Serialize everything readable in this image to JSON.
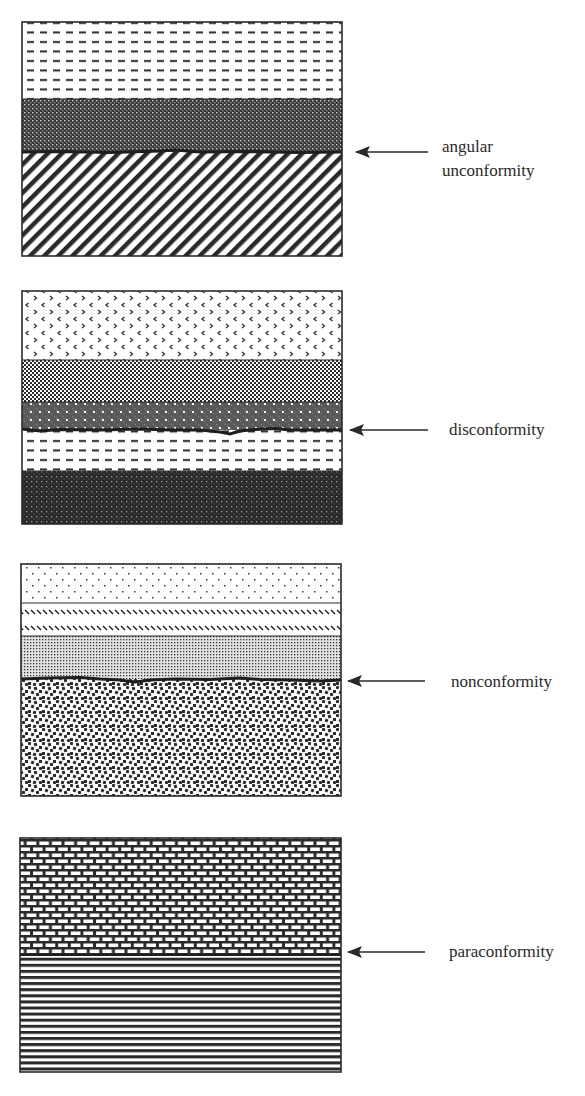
{
  "figure": {
    "panels": [
      {
        "id": "angular-unconformity",
        "label_lines": [
          "angular",
          "unconformity"
        ],
        "box": {
          "x": 22,
          "y": 22,
          "w": 320,
          "h": 234
        },
        "layers": [
          {
            "name": "shale",
            "pattern": "dashes",
            "y0": 22,
            "y1": 99
          },
          {
            "name": "crosshatch-dark",
            "pattern": "crosshatch",
            "y0": 99,
            "y1": 152
          },
          {
            "name": "tilted-strata",
            "pattern": "diagonal-lines",
            "y0": 152,
            "y1": 256
          }
        ],
        "contact_y": 152,
        "arrow": {
          "tip_x": 355,
          "tail_x": 428,
          "y": 152
        }
      },
      {
        "id": "disconformity",
        "label_lines": [
          "disconformity"
        ],
        "box": {
          "x": 22,
          "y": 291,
          "w": 320,
          "h": 233
        },
        "layers": [
          {
            "name": "chevron-layer",
            "pattern": "chevrons",
            "y0": 291,
            "y1": 360
          },
          {
            "name": "checker-layer",
            "pattern": "checker",
            "y0": 360,
            "y1": 402
          },
          {
            "name": "grey-dotted-layer",
            "pattern": "grey-dots",
            "y0": 402,
            "y1": 430
          },
          {
            "name": "shale",
            "pattern": "dashes",
            "y0": 430,
            "y1": 471
          },
          {
            "name": "dark-dotted-layer",
            "pattern": "dark-dots",
            "y0": 471,
            "y1": 524
          }
        ],
        "contact_y": 430,
        "arrow": {
          "tip_x": 349,
          "tail_x": 428,
          "y": 430
        }
      },
      {
        "id": "nonconformity",
        "label_lines": [
          "nonconformity"
        ],
        "box": {
          "x": 21,
          "y": 564,
          "w": 320,
          "h": 232
        },
        "layers": [
          {
            "name": "sandstone",
            "pattern": "sparse-dots",
            "y0": 564,
            "y1": 603
          },
          {
            "name": "backslash-layer",
            "pattern": "backslash-hatch",
            "y0": 603,
            "y1": 636
          },
          {
            "name": "siltstone",
            "pattern": "fine-dots",
            "y0": 636,
            "y1": 679
          },
          {
            "name": "igneous-basement",
            "pattern": "granite",
            "y0": 679,
            "y1": 796
          }
        ],
        "contact_y": 679,
        "arrow": {
          "tip_x": 347,
          "tail_x": 425,
          "y": 681
        }
      },
      {
        "id": "paraconformity",
        "label_lines": [
          "paraconformity"
        ],
        "box": {
          "x": 20,
          "y": 838,
          "w": 321,
          "h": 234
        },
        "layers": [
          {
            "name": "limestone",
            "pattern": "bricks",
            "y0": 838,
            "y1": 955
          },
          {
            "name": "laminated-shale",
            "pattern": "horizontal-lines",
            "y0": 955,
            "y1": 1072
          }
        ],
        "contact_y": 955,
        "arrow": {
          "tip_x": 347,
          "tail_x": 425,
          "y": 952
        }
      }
    ],
    "colors": {
      "ink": "#2a2a2a",
      "paper": "#ffffff"
    }
  }
}
